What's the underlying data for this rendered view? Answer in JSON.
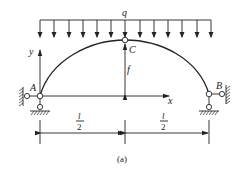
{
  "diagram": {
    "load_label": "q",
    "labels": {
      "support_a": "A",
      "support_b": "B",
      "crown": "C",
      "rise": "f",
      "x_axis": "x",
      "y_axis": "y"
    },
    "dimensions": {
      "left_span_num": "l",
      "left_span_den": "2",
      "right_span_num": "l",
      "right_span_den": "2"
    },
    "caption": "(a)",
    "colors": {
      "stroke": "#222222",
      "background": "#ffffff"
    }
  }
}
